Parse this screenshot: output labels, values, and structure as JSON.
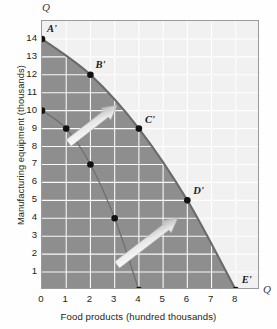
{
  "chart_data": {
    "type": "line",
    "title": "",
    "xlabel": "Food products (hundred thousands)",
    "ylabel": "Manufacturing equipment (thousands)",
    "xlim": [
      0,
      9
    ],
    "ylim": [
      0,
      15
    ],
    "xticks": [
      0,
      1,
      2,
      3,
      4,
      5,
      6,
      7,
      8
    ],
    "yticks": [
      1,
      2,
      3,
      4,
      5,
      6,
      7,
      8,
      9,
      10,
      11,
      12,
      13,
      14
    ],
    "grid": true,
    "legend": null,
    "axis_end_marks": {
      "vertical": "Q",
      "horizontal": "Q"
    },
    "series": [
      {
        "name": "Production possibilities frontier (outer)",
        "type": "curve",
        "points": [
          {
            "x": 0,
            "y": 14,
            "label": "A'"
          },
          {
            "x": 2,
            "y": 12,
            "label": "B'"
          },
          {
            "x": 4,
            "y": 9,
            "label": "C'"
          },
          {
            "x": 6,
            "y": 5,
            "label": "D'"
          },
          {
            "x": 8,
            "y": 0,
            "label": "E'"
          }
        ]
      },
      {
        "name": "Original production possibilities frontier (inner)",
        "type": "curve",
        "points": [
          {
            "x": 0,
            "y": 10,
            "label": ""
          },
          {
            "x": 1,
            "y": 9,
            "label": ""
          },
          {
            "x": 2,
            "y": 7,
            "label": ""
          },
          {
            "x": 3,
            "y": 4,
            "label": ""
          },
          {
            "x": 4,
            "y": 0,
            "label": ""
          }
        ]
      }
    ],
    "annotations": [
      {
        "name": "growth-arrow-upper",
        "from": {
          "x": 1.1,
          "y": 8.2
        },
        "to": {
          "x": 3.1,
          "y": 10.3
        },
        "shape": "arrow"
      },
      {
        "name": "growth-arrow-lower",
        "from": {
          "x": 3.1,
          "y": 1.4
        },
        "to": {
          "x": 5.6,
          "y": 4.0
        },
        "shape": "arrow"
      }
    ],
    "colors": {
      "plot_background": "#f1f1f1",
      "inner_region_fill": "#8e8e8e",
      "outer_region_fill": "#e2e2e2",
      "frontier_line": "#6a6a6a",
      "gridline": "#ffffff",
      "point_marker": "#111111",
      "axis_border": "#9a9a9a",
      "text": "#231f20"
    }
  }
}
